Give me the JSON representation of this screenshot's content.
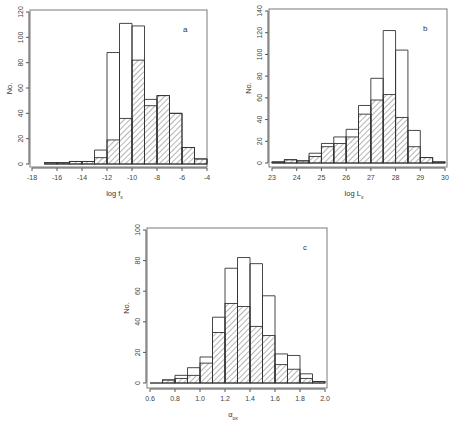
{
  "chart_data": [
    {
      "type": "bar",
      "panel": "a",
      "title": "",
      "xlabel": "log f_x",
      "ylabel": "No.",
      "xlim": [
        -18,
        -4
      ],
      "ylim": [
        0,
        120
      ],
      "xticks": [
        -18,
        -16,
        -14,
        -12,
        -10,
        -8,
        -6,
        -4
      ],
      "yticks": [
        0,
        20,
        40,
        60,
        80,
        100,
        120
      ],
      "bin_edges": [
        -17,
        -16,
        -15,
        -14,
        -13,
        -12,
        -11,
        -10,
        -9,
        -8,
        -7,
        -6,
        -5,
        -4
      ],
      "series": [
        {
          "name": "all (open)",
          "values": [
            1,
            1,
            2,
            2,
            11,
            88,
            111,
            109,
            51,
            54,
            40,
            13,
            4
          ]
        },
        {
          "name": "subset (hatched)",
          "values": [
            1,
            1,
            2,
            2,
            5,
            19,
            36,
            82,
            46,
            54,
            40,
            13,
            4
          ]
        }
      ],
      "grid": false,
      "legend": "none",
      "annotation": "a",
      "frame": {
        "x": 30,
        "y": 10,
        "w": 177,
        "h": 157
      },
      "plot": {
        "x0": 32,
        "x1": 207,
        "y0": 164,
        "y1": 12
      }
    },
    {
      "type": "bar",
      "panel": "b",
      "title": "",
      "xlabel": "log L_x",
      "ylabel": "No.",
      "xlim": [
        23,
        30
      ],
      "ylim": [
        0,
        140
      ],
      "xticks": [
        23,
        24,
        25,
        26,
        27,
        28,
        29,
        30
      ],
      "yticks": [
        0,
        20,
        40,
        60,
        80,
        100,
        120,
        140
      ],
      "bin_edges": [
        23,
        23.5,
        24,
        24.5,
        25,
        25.5,
        26,
        26.5,
        27,
        27.5,
        28,
        28.5,
        29,
        29.5,
        30
      ],
      "series": [
        {
          "name": "all (open)",
          "values": [
            1,
            3,
            2,
            9,
            18,
            24,
            31,
            53,
            78,
            122,
            104,
            30,
            5,
            1
          ]
        },
        {
          "name": "subset (hatched)",
          "values": [
            1,
            3,
            2,
            6,
            15,
            18,
            24,
            45,
            58,
            63,
            42,
            15,
            5,
            1
          ]
        }
      ],
      "grid": false,
      "legend": "none",
      "annotation": "b",
      "frame": {
        "x": 269,
        "y": 9,
        "w": 178,
        "h": 158
      },
      "plot": {
        "x0": 272,
        "x1": 445,
        "y0": 163,
        "y1": 11
      }
    },
    {
      "type": "bar",
      "panel": "c",
      "title": "",
      "xlabel": "α_ox",
      "ylabel": "No.",
      "xlim": [
        0.6,
        2.0
      ],
      "ylim": [
        0,
        100
      ],
      "xticks": [
        0.6,
        0.8,
        1.0,
        1.2,
        1.4,
        1.6,
        1.8,
        2.0
      ],
      "yticks": [
        0,
        20,
        40,
        60,
        80,
        100
      ],
      "bin_edges": [
        0.6,
        0.7,
        0.8,
        0.9,
        1.0,
        1.1,
        1.2,
        1.3,
        1.4,
        1.5,
        1.6,
        1.7,
        1.8,
        1.9,
        2.0
      ],
      "series": [
        {
          "name": "all (open)",
          "values": [
            0,
            2,
            5,
            10,
            17,
            43,
            75,
            82,
            78,
            57,
            19,
            18,
            6,
            1
          ]
        },
        {
          "name": "subset (hatched)",
          "values": [
            0,
            2,
            3,
            5,
            13,
            33,
            52,
            50,
            37,
            31,
            12,
            9,
            3,
            1
          ]
        }
      ],
      "grid": false,
      "legend": "none",
      "annotation": "c",
      "frame": {
        "x": 147,
        "y": 228,
        "w": 180,
        "h": 160
      },
      "plot": {
        "x0": 150,
        "x1": 325,
        "y0": 383,
        "y1": 230
      }
    }
  ],
  "panels": {
    "a": {
      "label": "a",
      "xlabel": "log f",
      "xlabel_sub": "x",
      "ylabel": "No."
    },
    "b": {
      "label": "b",
      "xlabel": "log L",
      "xlabel_sub": "x",
      "ylabel": "No."
    },
    "c": {
      "label": "c",
      "xlabel": "α",
      "xlabel_sub": "ox",
      "ylabel": "No."
    }
  }
}
